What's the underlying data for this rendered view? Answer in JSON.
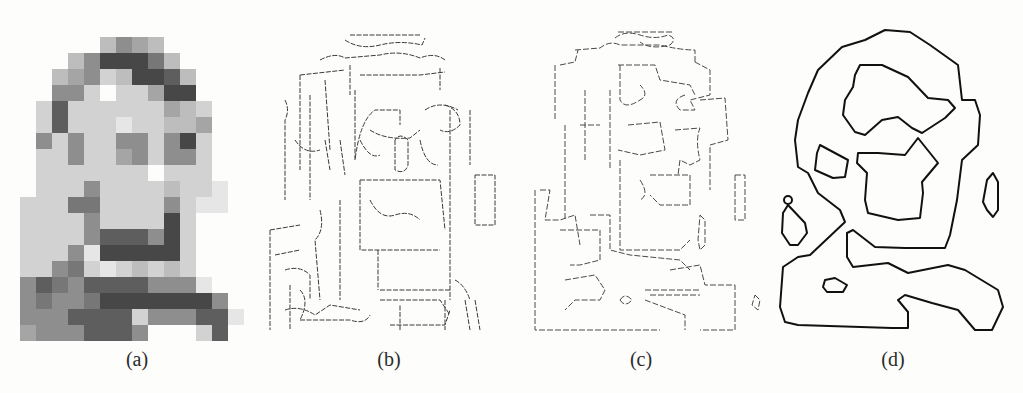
{
  "figure": {
    "panels": [
      {
        "id": "a",
        "label": "(a)",
        "description": "low-resolution pixelated portrait (grayscale blocks)"
      },
      {
        "id": "b",
        "label": "(b)",
        "description": "dense fine-scale edge map"
      },
      {
        "id": "c",
        "label": "(c)",
        "description": "medium-scale edge map"
      },
      {
        "id": "d",
        "label": "(d)",
        "description": "coarse-scale bold contours"
      }
    ],
    "pixel_grid": {
      "origin": [
        20,
        37
      ],
      "cell": 16,
      "cols": 14,
      "rows": 19,
      "levels": [
        [
          0,
          0,
          0,
          0,
          0,
          3,
          5,
          4,
          3,
          0,
          0,
          0,
          0,
          0
        ],
        [
          0,
          0,
          0,
          3,
          5,
          8,
          8,
          8,
          6,
          3,
          0,
          0,
          0,
          0
        ],
        [
          0,
          0,
          3,
          4,
          5,
          2,
          3,
          8,
          8,
          7,
          3,
          0,
          0,
          0
        ],
        [
          0,
          0,
          5,
          5,
          2,
          0,
          2,
          2,
          4,
          8,
          8,
          0,
          0,
          0
        ],
        [
          0,
          2,
          7,
          2,
          2,
          2,
          2,
          2,
          2,
          4,
          3,
          2,
          0,
          0
        ],
        [
          0,
          2,
          7,
          2,
          2,
          2,
          1,
          2,
          2,
          3,
          3,
          4,
          0,
          0
        ],
        [
          0,
          5,
          2,
          5,
          2,
          2,
          5,
          5,
          2,
          5,
          8,
          2,
          0,
          0
        ],
        [
          0,
          2,
          2,
          5,
          2,
          2,
          4,
          5,
          2,
          5,
          5,
          2,
          0,
          0
        ],
        [
          0,
          2,
          2,
          2,
          2,
          2,
          2,
          2,
          0,
          2,
          2,
          2,
          0,
          0
        ],
        [
          0,
          2,
          2,
          2,
          5,
          2,
          2,
          2,
          2,
          3,
          2,
          2,
          1,
          0
        ],
        [
          2,
          2,
          2,
          6,
          6,
          2,
          2,
          2,
          2,
          5,
          2,
          1,
          1,
          0
        ],
        [
          2,
          2,
          2,
          2,
          5,
          2,
          2,
          2,
          2,
          8,
          2,
          0,
          0,
          0
        ],
        [
          2,
          2,
          2,
          2,
          5,
          7,
          7,
          7,
          5,
          8,
          2,
          0,
          0,
          0
        ],
        [
          2,
          2,
          2,
          5,
          1,
          8,
          8,
          8,
          8,
          8,
          2,
          0,
          0,
          0
        ],
        [
          2,
          2,
          5,
          6,
          2,
          1,
          2,
          3,
          2,
          3,
          2,
          0,
          0,
          0
        ],
        [
          5,
          7,
          6,
          5,
          7,
          7,
          7,
          7,
          5,
          5,
          5,
          1,
          0,
          0
        ],
        [
          5,
          6,
          5,
          5,
          6,
          8,
          8,
          8,
          8,
          8,
          8,
          8,
          5,
          0
        ],
        [
          5,
          5,
          5,
          7,
          7,
          7,
          7,
          2,
          5,
          5,
          5,
          7,
          7,
          1
        ],
        [
          4,
          5,
          5,
          5,
          7,
          7,
          7,
          5,
          0,
          0,
          0,
          2,
          7,
          0
        ]
      ],
      "palette": [
        "transparent",
        "#e6e6e6",
        "#d2d2d2",
        "#bdbdbd",
        "#a5a5a5",
        "#8e8e8e",
        "#777777",
        "#5e5e5e",
        "#474747",
        "#333333"
      ]
    },
    "contours_d": [
      {
        "name": "outer-contour",
        "points": "885,30 910,32 930,45 958,65 962,100 975,100 980,115 978,145 962,160 957,200 950,235 945,248 905,248 875,247 853,230 847,233 847,257 853,267 888,263 908,273 948,265 965,270 998,290 1003,307 992,330 975,330 958,310 932,303 905,295 898,300 908,312 908,328 892,328 798,325 785,322 780,307 783,267 798,257 810,255 845,222 840,210 818,193 808,173 798,167 795,140 798,120 808,93 818,70 842,47 865,40 885,30"
      },
      {
        "name": "hair-contour",
        "points": "860,65 882,65 908,77 928,98 948,100 955,108 945,118 922,133 912,128 898,117 882,120 865,135 855,132 843,115 845,100 853,87 855,75 860,65"
      },
      {
        "name": "face-contour",
        "points": "918,138 938,163 922,182 923,193 920,218 898,220 868,213 865,200 867,173 857,163 858,153 878,153 905,155 918,138"
      },
      {
        "name": "eye-contour",
        "points": "820,145 848,160 845,177 833,178 815,170 817,153 820,145"
      },
      {
        "name": "ear-contour",
        "points": "993,173 998,182 998,210 993,217 987,210 983,202 987,180 993,173"
      },
      {
        "name": "teardrop-contour",
        "points": "788,205 805,223 807,233 798,245 790,245 782,233 783,213 788,205"
      },
      {
        "name": "body-loop-contour",
        "points": "825,280 835,278 847,285 843,292 827,292 823,287 825,280"
      }
    ],
    "circle_d": {
      "cx": 788,
      "cy": 200,
      "r": 4
    },
    "edges_b": [
      "M 350 35 L 420 35",
      "M 345 40 Q 360 50 380 45 Q 400 40 422 45 L 425 38",
      "M 320 60 Q 335 52 345 58 L 380 55 Q 400 50 420 58 Q 435 52 445 60",
      "M 300 75 L 345 70 M 350 65 L 350 95 M 360 75 L 420 75 L 445 72 M 440 68 L 440 90",
      "M 300 75 L 300 170 M 310 95 L 310 200",
      "M 325 80 L 330 150",
      "M 355 90 L 355 160 Q 360 120 375 110 L 400 110 L 400 125",
      "M 370 130 Q 385 140 410 138 L 420 130 M 425 110 Q 440 100 458 110",
      "M 445 105 Q 460 110 460 125 Q 450 135 440 130",
      "M 285 100 Q 290 110 285 120 L 285 200",
      "M 295 140 Q 305 155 320 150 M 325 140 L 330 170",
      "M 340 140 L 345 175",
      "M 360 140 Q 370 160 380 155",
      "M 395 140 L 395 170 Q 405 175 408 165 L 408 140 Q 400 132 395 140",
      "M 420 140 Q 425 165 438 165",
      "M 450 110 L 450 300",
      "M 470 110 L 470 165",
      "M 360 180 L 440 180 L 445 230",
      "M 360 180 L 360 250 L 440 250",
      "M 370 200 Q 380 220 395 215 Q 410 210 420 220",
      "M 378 250 L 378 290 M 380 290 L 450 290",
      "M 340 200 L 340 300",
      "M 320 210 Q 325 230 315 240 L 320 300",
      "M 270 230 L 300 225 M 270 230 L 270 330",
      "M 275 255 L 300 250",
      "M 285 270 Q 300 265 310 275 L 310 300",
      "M 285 310 Q 300 305 315 315 L 330 305 L 360 310",
      "M 300 320 L 350 320 Q 365 325 370 315",
      "M 380 300 L 440 300 L 450 315",
      "M 390 325 L 445 325 L 450 310",
      "M 400 330 L 400 305 M 445 300 L 445 330",
      "M 475 175 L 495 175 L 495 225 L 475 225 Z",
      "M 455 280 Q 465 285 470 300 M 465 300 L 470 330",
      "M 475 300 L 480 330",
      "M 290 285 L 290 330 M 300 290 Q 310 300 300 320"
    ],
    "edges_c": [
      "M 618 32 L 672 32",
      "M 615 38 Q 625 30 640 35 Q 655 40 668 35 Q 678 38 670 45 Q 650 50 640 42",
      "M 575 50 L 600 48 Q 610 40 620 45 L 660 45 Q 680 50 695 50 L 695 62",
      "M 560 65 L 575 62 L 578 50",
      "M 555 65 L 555 120",
      "M 618 65 L 655 65 L 660 80 L 690 85 L 695 95",
      "M 620 65 L 620 100 Q 625 110 640 100 Q 650 95 640 85",
      "M 695 62 L 710 70 L 710 95 L 690 100 L 695 110 L 680 110 Q 670 100 685 95",
      "M 585 90 L 585 160 M 610 90 L 610 170",
      "M 700 100 L 725 98 L 728 140 L 710 145 L 710 190",
      "M 565 125 L 565 220 M 580 125 L 600 125",
      "M 628 125 L 660 122 L 665 150 L 640 155 L 618 150",
      "M 675 130 L 700 128 Q 695 140 700 160 L 690 165 L 680 160 L 678 175",
      "M 620 160 L 620 250 L 680 250 L 690 240",
      "M 650 175 L 690 175 L 690 205 L 660 205 L 650 195",
      "M 640 180 Q 650 195 640 200",
      "M 735 175 L 745 175 L 745 220 L 735 220 Z",
      "M 540 190 L 550 190 L 545 220 L 560 220 L 575 215 L 580 245",
      "M 535 190 L 535 330 L 660 330",
      "M 560 230 L 600 230 L 600 260 L 580 265 L 570 265",
      "M 590 215 L 610 215 L 610 250 L 630 255 L 680 260 L 690 270",
      "M 670 270 L 700 265 L 705 285 L 735 285 L 735 330 L 700 330",
      "M 565 280 L 595 275 L 605 290 L 600 300 L 575 300 L 565 310",
      "M 620 300 Q 625 292 632 300 Q 625 308 620 300",
      "M 645 290 L 700 290 M 650 295 L 700 295",
      "M 645 300 L 685 315 L 685 330",
      "M 755 295 L 760 300 L 758 310 L 752 305 Z",
      "M 700 215 L 705 220 L 705 245 L 700 250 L 698 240 Z"
    ]
  }
}
